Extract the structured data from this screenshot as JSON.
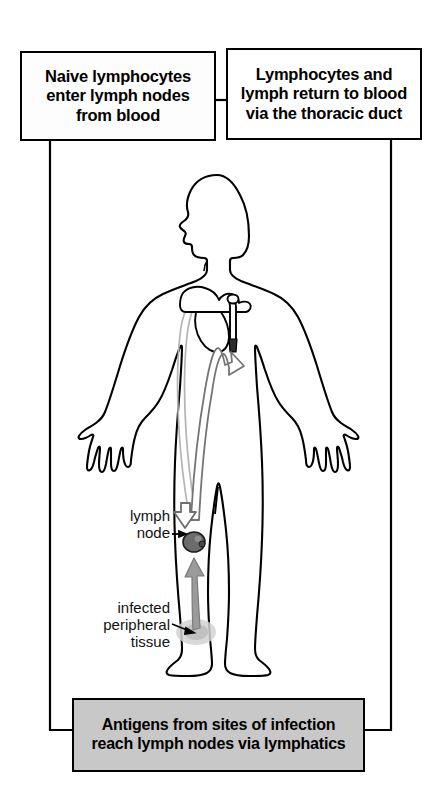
{
  "diagram": {
    "title_boxes": {
      "naive": {
        "id": "naive-lymphocytes-box",
        "text": "Naive lymphocytes\nenter lymph nodes\nfrom blood",
        "fill": "#fdfdfd",
        "border": "#000000"
      },
      "thoracic": {
        "id": "thoracic-duct-box",
        "text": "Lymphocytes and\nlymph return to blood\nvia the thoracic duct",
        "fill": "#ffffff",
        "border": "#000000"
      },
      "antigens": {
        "id": "antigens-box",
        "text": "Antigens from sites of infection\nreach lymph nodes via lymphatics",
        "fill": "#c8c8c8",
        "border": "#000000"
      }
    },
    "callouts": [
      {
        "id": "lymph-node-callout",
        "text": "lymph\nnode",
        "points_to": "lymph-node-marker"
      },
      {
        "id": "infected-tissue-callout",
        "text": "infected\nperipheral\ntissue",
        "points_to": "infected-tissue-marker"
      }
    ],
    "anatomy": {
      "figure": "human-body-outline-front-view-head-in-profile",
      "outline_color": "#000000",
      "body_fill": "#ffffff"
    },
    "markers": {
      "lymph_node": {
        "label": "lymph node",
        "fill": "#6e6e6e",
        "stroke": "#1a1a1a"
      },
      "infected_tissue": {
        "label": "infected peripheral tissue",
        "fill": "#bdbdbd"
      },
      "afferent_lymphatic": {
        "label": "antigen flow from infected tissue to lymph node",
        "fill": "#9a9a9a",
        "direction": "up"
      },
      "blood_vessels": {
        "label": "blood vessels carrying naive lymphocytes to lymph node",
        "stroke": "#b0b0b0"
      },
      "efferent_duct": {
        "label": "thoracic duct returning lymph to blood",
        "fill": "#ffffff",
        "stroke": "#6e6e6e",
        "direction": "up"
      },
      "heart": {
        "label": "heart and great vessels",
        "stroke": "#000000"
      }
    },
    "connectors": {
      "color": "#000000",
      "left_rail": "from naive-lymphocytes-box down the left side to antigens-box",
      "right_rail": "from thoracic-duct-box down the right side to antigens-box",
      "box_bridge": "short horizontal link between the two top boxes"
    }
  }
}
